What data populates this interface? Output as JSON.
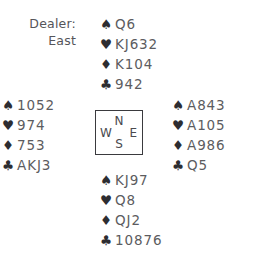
{
  "diagram": {
    "type": "bridge-hand-deal",
    "background_color": "#ffffff",
    "suit_symbol_color": "#2d2d31",
    "card_text_color": "#5c5c60"
  },
  "dealer": {
    "label": "Dealer:",
    "value": "East"
  },
  "suit_glyphs": {
    "spade": "♠",
    "heart": "♥",
    "diamond": "♦",
    "club": "♣"
  },
  "hands": {
    "north": {
      "position": "North",
      "spades": "Q6",
      "hearts": "KJ632",
      "diamonds": "K104",
      "clubs": "942"
    },
    "west": {
      "position": "West",
      "spades": "1052",
      "hearts": "974",
      "diamonds": "753",
      "clubs": "AKJ3"
    },
    "east": {
      "position": "East",
      "spades": "A843",
      "hearts": "A105",
      "diamonds": "A986",
      "clubs": "Q5"
    },
    "south": {
      "position": "South",
      "spades": "KJ97",
      "hearts": "Q8",
      "diamonds": "QJ2",
      "clubs": "10876"
    }
  },
  "compass": {
    "north": "N",
    "west": "W",
    "east": "E",
    "south": "S"
  }
}
